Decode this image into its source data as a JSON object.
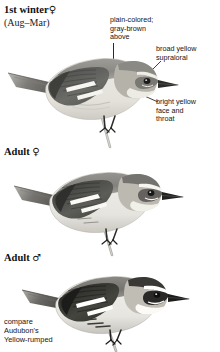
{
  "plate": {
    "type": "field-guide-plate",
    "subject": "wood-warbler",
    "palette": {
      "ink": "#141414",
      "leader_line": "#2b2b2b",
      "upperpart_gray": "#8d8d8a",
      "upperpart_gray_dark": "#6d6d6b",
      "wing_black": "#2e2e2e",
      "wing_bar_white": "#fbfbfa",
      "underpart_white": "#f2f1ee",
      "flank_shadow": "#c9c7c1",
      "face_yellow_gray": "#b9b6ad",
      "bill_black": "#232323",
      "eye_black": "#1b1b1b",
      "branch_gray": "#b3b1ab",
      "background": "#ffffff"
    }
  },
  "figures": [
    {
      "id": "first-winter-female",
      "heading": "1st winter",
      "heading_symbol": "♀",
      "subheading": "(Aug–Mar)",
      "facing": "right",
      "perched": true
    },
    {
      "id": "adult-female",
      "heading": "Adult",
      "heading_symbol": "♀",
      "subheading": "",
      "facing": "right",
      "perched": true
    },
    {
      "id": "adult-male",
      "heading": "Adult",
      "heading_symbol": "♂",
      "subheading": "",
      "facing": "right",
      "perched": true
    }
  ],
  "annotations": [
    {
      "id": "upperparts",
      "lines": [
        "plain-colored;",
        "gray-brown",
        "above"
      ],
      "target": "mantle"
    },
    {
      "id": "supraloral",
      "lines": [
        "broad yellow",
        "supraloral"
      ],
      "target": "supraloral-stripe"
    },
    {
      "id": "face-throat",
      "lines": [
        "bright yellow",
        "face and",
        "throat"
      ],
      "target": "throat"
    }
  ],
  "compare_note": {
    "lines": [
      "compare",
      "Audubon's",
      "Yellow-rumped"
    ]
  }
}
